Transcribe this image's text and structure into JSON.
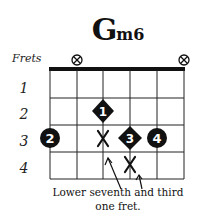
{
  "chord": {
    "root": "G",
    "quality": "m6"
  },
  "labels": {
    "frets_label": "Frets",
    "fret_numbers": [
      "1",
      "2",
      "3",
      "4"
    ]
  },
  "strings": 6,
  "muted_strings": [
    2,
    6
  ],
  "fingerings": [
    {
      "string": 1,
      "fret": 3,
      "finger": "2",
      "shape": "circle"
    },
    {
      "string": 3,
      "fret": 2,
      "finger": "1",
      "shape": "diamond"
    },
    {
      "string": 4,
      "fret": 3,
      "finger": "3",
      "shape": "diamond"
    },
    {
      "string": 5,
      "fret": 3,
      "finger": "4",
      "shape": "circle"
    }
  ],
  "alterations": [
    {
      "string": 3,
      "fret": 3,
      "marker": "X"
    },
    {
      "string": 4,
      "fret": 4,
      "marker": "X"
    }
  ],
  "annotation": {
    "line1": "Lower seventh and third",
    "line2": "one fret."
  },
  "colors": {
    "ink": "#111111",
    "background": "#ffffff"
  }
}
